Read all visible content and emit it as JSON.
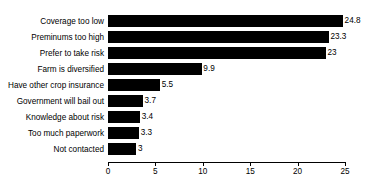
{
  "chart_data": {
    "type": "bar",
    "orientation": "horizontal",
    "title": "",
    "subtitle": "",
    "xlabel": "",
    "ylabel": "",
    "xlim": [
      0,
      25
    ],
    "xticks": [
      0,
      5,
      10,
      15,
      20,
      25
    ],
    "grid": false,
    "legend": null,
    "bar_color": "#000000",
    "background_color": "#ffffff",
    "categories": [
      "Coverage too low",
      "Preminums too high",
      "Prefer to take risk",
      "Farm is diversified",
      "Have other crop insurance",
      "Government will bail out",
      "Knowledge about risk",
      "Too much paperwork",
      "Not contacted"
    ],
    "values": [
      24.8,
      23.3,
      23,
      9.9,
      5.5,
      3.7,
      3.4,
      3.3,
      3
    ],
    "value_labels": [
      "24.8",
      "23.3",
      "23",
      "9.9",
      "5.5",
      "3.7",
      "3.4",
      "3.3",
      "3"
    ],
    "bars": [
      {
        "category": "Coverage too low",
        "value": 24.8,
        "label": "24.8"
      },
      {
        "category": "Preminums too high",
        "value": 23.3,
        "label": "23.3"
      },
      {
        "category": "Prefer to take risk",
        "value": 23,
        "label": "23"
      },
      {
        "category": "Farm is diversified",
        "value": 9.9,
        "label": "9.9"
      },
      {
        "category": "Have other crop insurance",
        "value": 5.5,
        "label": "5.5"
      },
      {
        "category": "Government will bail out",
        "value": 3.7,
        "label": "3.7"
      },
      {
        "category": "Knowledge about risk",
        "value": 3.4,
        "label": "3.4"
      },
      {
        "category": "Too much paperwork",
        "value": 3.3,
        "label": "3.3"
      },
      {
        "category": "Not contacted",
        "value": 3,
        "label": "3"
      }
    ],
    "xtick_labels": [
      "0",
      "5",
      "10",
      "15",
      "20",
      "25"
    ]
  }
}
